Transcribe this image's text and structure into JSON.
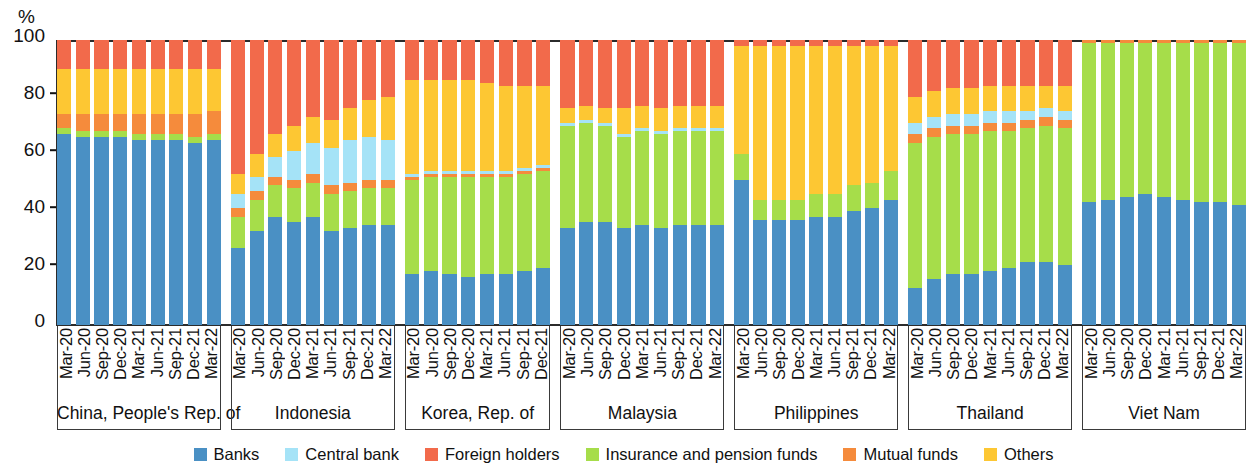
{
  "chart_data": {
    "type": "bar",
    "subtype": "stacked-percentage",
    "title": "",
    "xlabel": "",
    "ylabel": "%",
    "ylim": [
      0,
      100
    ],
    "yticks": [
      0,
      20,
      40,
      60,
      80,
      100
    ],
    "grid": false,
    "legend_position": "bottom",
    "stacking_order_bottom_to_top": [
      "Banks",
      "Insurance and pension funds",
      "Mutual funds",
      "Central bank",
      "Others",
      "Foreign holders"
    ],
    "series": [
      {
        "name": "Banks",
        "color": "#4a90c4"
      },
      {
        "name": "Central bank",
        "color": "#a5e3f7"
      },
      {
        "name": "Foreign holders",
        "color": "#f26a4b"
      },
      {
        "name": "Insurance and pension funds",
        "color": "#a6dd4a"
      },
      {
        "name": "Mutual funds",
        "color": "#f58b3c"
      },
      {
        "name": "Others",
        "color": "#fdc733"
      }
    ],
    "panels": [
      {
        "name": "China, People's Rep. of",
        "categories": [
          "Mar-20",
          "Jun-20",
          "Sep-20",
          "Dec-20",
          "Mar-21",
          "Jun-21",
          "Sep-21",
          "Dec-21",
          "Mar-22"
        ],
        "data": {
          "Banks": [
            67,
            66,
            66,
            66,
            65,
            65,
            65,
            64,
            65
          ],
          "Insurance and pension funds": [
            2,
            2,
            2,
            2,
            2,
            2,
            2,
            2,
            2
          ],
          "Mutual funds": [
            5,
            6,
            6,
            6,
            7,
            7,
            7,
            8,
            8
          ],
          "Central bank": [
            0,
            0,
            0,
            0,
            0,
            0,
            0,
            0,
            0
          ],
          "Others": [
            16,
            16,
            16,
            16,
            16,
            16,
            16,
            16,
            15
          ],
          "Foreign holders": [
            10,
            10,
            10,
            10,
            10,
            10,
            10,
            10,
            10
          ]
        }
      },
      {
        "name": "Indonesia",
        "categories": [
          "Mar-20",
          "Jun-20",
          "Sep-20",
          "Dec-20",
          "Mar-21",
          "Jun-21",
          "Sep-21",
          "Dec-21",
          "Mar-22"
        ],
        "data": {
          "Banks": [
            27,
            33,
            38,
            36,
            38,
            33,
            34,
            35,
            35
          ],
          "Insurance and pension funds": [
            11,
            11,
            11,
            12,
            12,
            13,
            13,
            13,
            13
          ],
          "Mutual funds": [
            3,
            3,
            3,
            3,
            3,
            3,
            3,
            3,
            3
          ],
          "Central bank": [
            5,
            5,
            7,
            10,
            11,
            13,
            15,
            15,
            14
          ],
          "Others": [
            7,
            8,
            8,
            9,
            9,
            10,
            11,
            13,
            15
          ],
          "Foreign holders": [
            47,
            40,
            33,
            30,
            27,
            28,
            24,
            21,
            20
          ]
        }
      },
      {
        "name": "Korea, Rep. of",
        "categories": [
          "Mar-20",
          "Jun-20",
          "Sep-20",
          "Dec-20",
          "Mar-21",
          "Jun-21",
          "Sep-21",
          "Dec-21"
        ],
        "data": {
          "Banks": [
            18,
            19,
            18,
            17,
            18,
            18,
            19,
            20
          ],
          "Insurance and pension funds": [
            33,
            33,
            34,
            35,
            34,
            34,
            34,
            34
          ],
          "Mutual funds": [
            1,
            1,
            1,
            1,
            1,
            1,
            1,
            1
          ],
          "Central bank": [
            1,
            1,
            1,
            1,
            1,
            1,
            1,
            1
          ],
          "Others": [
            33,
            32,
            32,
            32,
            31,
            30,
            29,
            28
          ],
          "Foreign holders": [
            14,
            14,
            14,
            14,
            15,
            16,
            16,
            16
          ]
        }
      },
      {
        "name": "Malaysia",
        "categories": [
          "Mar-20",
          "Jun-20",
          "Sep-20",
          "Dec-20",
          "Mar-21",
          "Jun-21",
          "Sep-21",
          "Dec-21",
          "Mar-22"
        ],
        "data": {
          "Banks": [
            34,
            36,
            36,
            34,
            35,
            34,
            35,
            35,
            35
          ],
          "Insurance and pension funds": [
            36,
            35,
            34,
            32,
            33,
            33,
            33,
            33,
            33
          ],
          "Mutual funds": [
            0,
            0,
            0,
            0,
            0,
            0,
            0,
            0,
            0
          ],
          "Central bank": [
            1,
            1,
            1,
            1,
            1,
            1,
            1,
            1,
            1
          ],
          "Others": [
            5,
            5,
            5,
            9,
            8,
            8,
            8,
            8,
            8
          ],
          "Foreign holders": [
            24,
            23,
            24,
            24,
            23,
            24,
            23,
            23,
            23
          ]
        }
      },
      {
        "name": "Philippines",
        "categories": [
          "Mar-20",
          "Jun-20",
          "Sep-20",
          "Dec-20",
          "Mar-21",
          "Jun-21",
          "Sep-21",
          "Dec-21",
          "Mar-22"
        ],
        "data": {
          "Banks": [
            51,
            37,
            37,
            37,
            38,
            38,
            40,
            41,
            44
          ],
          "Insurance and pension funds": [
            9,
            7,
            7,
            7,
            8,
            8,
            9,
            9,
            10
          ],
          "Mutual funds": [
            0,
            0,
            0,
            0,
            0,
            0,
            0,
            0,
            0
          ],
          "Central bank": [
            0,
            0,
            0,
            0,
            0,
            0,
            0,
            0,
            0
          ],
          "Others": [
            38,
            54,
            54,
            54,
            52,
            52,
            49,
            48,
            44
          ],
          "Foreign holders": [
            2,
            2,
            2,
            2,
            2,
            2,
            2,
            2,
            2
          ]
        }
      },
      {
        "name": "Thailand",
        "categories": [
          "Mar-20",
          "Jun-20",
          "Sep-20",
          "Dec-20",
          "Mar-21",
          "Jun-21",
          "Sep-21",
          "Dec-21",
          "Mar-22"
        ],
        "data": {
          "Banks": [
            13,
            16,
            18,
            18,
            19,
            20,
            22,
            22,
            21
          ],
          "Insurance and pension funds": [
            51,
            50,
            49,
            49,
            49,
            48,
            47,
            48,
            48
          ],
          "Mutual funds": [
            3,
            3,
            3,
            3,
            3,
            3,
            3,
            3,
            3
          ],
          "Central bank": [
            4,
            4,
            4,
            4,
            4,
            4,
            3,
            3,
            3
          ],
          "Others": [
            9,
            9,
            9,
            9,
            9,
            9,
            9,
            8,
            9
          ],
          "Foreign holders": [
            20,
            18,
            17,
            17,
            16,
            16,
            16,
            16,
            16
          ]
        }
      },
      {
        "name": "Viet Nam",
        "categories": [
          "Mar-20",
          "Jun-20",
          "Sep-20",
          "Dec-20",
          "Mar-21",
          "Jun-21",
          "Sep-21",
          "Dec-21",
          "Mar-22"
        ],
        "data": {
          "Banks": [
            43,
            44,
            45,
            46,
            45,
            44,
            43,
            43,
            42
          ],
          "Insurance and pension funds": [
            56,
            55,
            54,
            53,
            54,
            55,
            56,
            56,
            57
          ],
          "Mutual funds": [
            1,
            1,
            1,
            1,
            1,
            1,
            1,
            1,
            1
          ],
          "Central bank": [
            0,
            0,
            0,
            0,
            0,
            0,
            0,
            0,
            0
          ],
          "Others": [
            0,
            0,
            0,
            0,
            0,
            0,
            0,
            0,
            0
          ],
          "Foreign holders": [
            0,
            0,
            0,
            0,
            0,
            0,
            0,
            0,
            0
          ]
        }
      }
    ]
  },
  "axis": {
    "y_unit_label": "%",
    "y_tick_labels": [
      "0",
      "20",
      "40",
      "60",
      "80",
      "100"
    ]
  },
  "legend": {
    "items": [
      {
        "label": "Banks",
        "color": "#4a90c4"
      },
      {
        "label": "Central bank",
        "color": "#a5e3f7"
      },
      {
        "label": "Foreign holders",
        "color": "#f26a4b"
      },
      {
        "label": "Insurance and pension funds",
        "color": "#a6dd4a"
      },
      {
        "label": "Mutual funds",
        "color": "#f58b3c"
      },
      {
        "label": "Others",
        "color": "#fdc733"
      }
    ]
  }
}
